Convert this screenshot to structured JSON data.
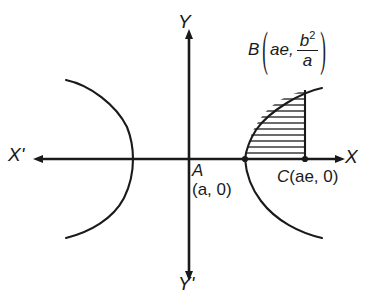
{
  "figure": {
    "background_color": "#ffffff",
    "stroke_color": "#1a1a1a",
    "axes": {
      "x_axis_label": "X",
      "x_axis_negative_label": "X'",
      "y_axis_label": "Y",
      "y_axis_negative_label": "Y'",
      "origin_x": 189,
      "origin_y": 159
    },
    "points": [
      {
        "name": "A",
        "label": "A",
        "coord_text": "(a, 0)",
        "x": 245,
        "y": 159,
        "marker": "dot"
      },
      {
        "name": "C",
        "label": "C(ae, 0)",
        "letter": "C",
        "coord_text": "(ae, 0)",
        "x": 305,
        "y": 159,
        "marker": "dot"
      },
      {
        "name": "B",
        "label": "B",
        "coord_first": "ae,",
        "fraction_numerator": "b",
        "fraction_numerator_exponent": "2",
        "fraction_denominator": "a",
        "x": 305,
        "y": 95,
        "marker": "none"
      }
    ],
    "curves": [
      {
        "name": "right-branch",
        "vertex_x": 245,
        "description": "hyperbola right branch opening rightward"
      },
      {
        "name": "left-branch",
        "vertex_x": 133,
        "description": "hyperbola left branch opening leftward"
      }
    ],
    "shaded_region": {
      "name": "hatched-latus-rectum-region",
      "pattern": "horizontal-hatching",
      "bounded_by": [
        "right-branch",
        "vertical-line-at-C",
        "x-axis"
      ]
    }
  }
}
